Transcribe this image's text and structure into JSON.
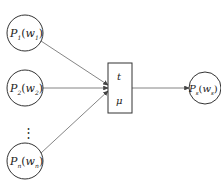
{
  "diagram": {
    "inputs": [
      {
        "name": "P",
        "sub": "1",
        "arg": "w",
        "argsub": "1"
      },
      {
        "name": "P",
        "sub": "2",
        "arg": "w",
        "argsub": "2"
      },
      {
        "name": "P",
        "sub": "n",
        "arg": "w",
        "argsub": "n"
      }
    ],
    "ellipsis": "⋮",
    "box": {
      "top_label": "t",
      "bottom_label": "μ"
    },
    "output": {
      "name": "P",
      "sub": "s",
      "arg": "w",
      "argsub": "s"
    },
    "colors": {
      "stroke": "#333333",
      "arrow": "#555555",
      "background": "#ffffff"
    }
  }
}
